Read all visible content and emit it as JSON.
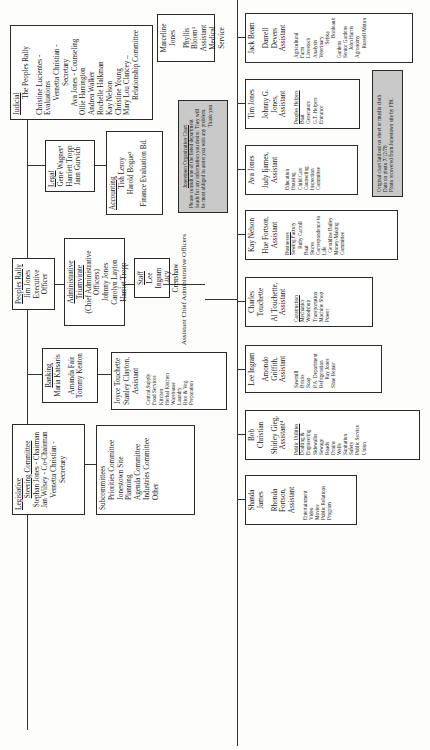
{
  "document": {
    "type": "Peoples Temple organizational chart (scanned, rotated)",
    "orientation": "rotated 90 degrees counter-clockwise"
  },
  "top_row": {
    "legislative": {
      "heading": "Legislative",
      "subheading": "Steering Committee",
      "members": [
        "Stephan Jones - Chairman",
        "Jan Wilsey - Co-Chairman",
        "Vernetta Christian -",
        "Secretary"
      ]
    },
    "subcommittees": {
      "heading": "Subcommittees",
      "items": [
        "Priorities Committee",
        "Jonestown Site",
        "Planning",
        "Agenda Committee",
        "Industries Committee",
        "Other"
      ]
    },
    "banking": {
      "heading": "Banking",
      "members": [
        "Maria Katsaris",
        "Amanda Fair",
        "Tommy Keaton"
      ]
    },
    "food": {
      "heads": [
        "Joyce Touchette",
        "Stanley Clayton,",
        "Assistant"
      ],
      "items": [
        "Central Supply",
        "Food Services",
        "Kitchen",
        "Herbal Kitchen",
        "Warehouse",
        "Laundry",
        "Rice & Veg. Preparation"
      ]
    },
    "peoples_rally": {
      "heading": "Peoples Rally",
      "lines": [
        "Jim Jones",
        "Executive Officer"
      ]
    },
    "admin_triumvirate": {
      "heading": "Administrative Triumvirate",
      "subheading": "(Chief Administrative Officers)",
      "members": [
        "Johnny Jones",
        "Carolyn Layton",
        "Harriet Tropp"
      ]
    },
    "staff": {
      "heading": "Staff",
      "members": [
        "Lee Ingram",
        "Lucy Crenshaw"
      ]
    },
    "assistant_label": "Assistant Chief Administrative Officers",
    "legal": {
      "heading": "Legal",
      "members": [
        "Gene Wagner¹",
        "Harriett Tropp",
        "Jann Gurvich"
      ]
    },
    "accounting": {
      "heading": "Accounting",
      "members": [
        "Tish Leroy",
        "Harold Bogue²"
      ],
      "footer": "Finance Evaluation Bd."
    },
    "notice": {
      "title": "Jonestown Organization Chart",
      "body": [
        "Please consult one of the listed department",
        "heads for any information you desire. They will",
        "be most obliged to assist you with any problem."
      ],
      "signoff": "Thank you"
    },
    "judicial": {
      "heading": "Judicial",
      "subheading": "The Peoples Rally",
      "members": [
        "Christine Lucientes - Evaluations",
        "Vernetta Christian - Secretary",
        "Ava Jones - Counseling",
        "Ollie Harrington",
        "Andrea Walker",
        "Rochelle Halkman",
        "Kay Nelson",
        "Christine Young",
        "Mary Lou Clancey –",
        "Relationship Committee"
      ]
    },
    "medical": {
      "lines": [
        "Marceline Jones",
        "Phyllis Bloom³",
        "Assistant",
        "Medical Service"
      ]
    }
  },
  "departments": [
    {
      "head": "Shanda James",
      "assistant": [
        "Rhonda Fortson,",
        "Assistant"
      ],
      "area_heading": "",
      "items": [
        "Entertainment",
        "Video",
        "Movies",
        "Public Relations",
        "Program"
      ]
    },
    {
      "head": "Bob Christian",
      "assistant": [
        "Shirley Gieg,",
        "Assistant⁴"
      ],
      "area_heading": "Public Utilities",
      "items": [
        "Drafting &",
        "Engineering",
        "Sidewalks",
        "Sewage",
        "Roads",
        "Drains",
        "Wells",
        "Sanitation",
        "Safety",
        "Public Service",
        "Union"
      ]
    },
    {
      "head": "Lee Ingram",
      "assistant": [
        "Amondo",
        "Griffith,",
        "Assistant"
      ],
      "area_heading": "",
      "items": [
        "Sawmill",
        "Bricks",
        "Soap",
        "P.A. Department",
        "Refrigeration",
        "Ray Jones",
        "Shoe Repair"
      ]
    },
    {
      "head": "Charles Touchette",
      "assistant": [
        "Al Touchette,",
        "Assistant"
      ],
      "area_heading": "Construction",
      "items": [
        "Mechanics",
        "Woodshop",
        "Transportation",
        "Machine Shop",
        "Power"
      ]
    },
    {
      "head": "Kay Nelson",
      "assistant": [
        "Hue Fortson,",
        "Assistant"
      ],
      "area_heading": "Businesses",
      "items": [
        "Sewing Factory",
        "Ruby Carroll",
        "Boat",
        "Stores",
        "Correspondence to",
        "Life",
        "Geraldine Bailey",
        "Money-Making",
        "Committee"
      ]
    },
    {
      "head": "Ava Jones",
      "assistant": [
        "Judy Ijames,",
        "Assistant"
      ],
      "area_heading": "",
      "items": [
        "Education",
        "Housing",
        "Child Care",
        "Counseling",
        "Inspection",
        "Committee"
      ]
    },
    {
      "head": "Tim Jones",
      "assistant": [
        "Johnny G. Jones,",
        "Assistant"
      ],
      "area_heading": "Peoples Helpers",
      "items": [
        "Boat",
        "Generators",
        "G.T. Helpers",
        "Entrance"
      ]
    },
    {
      "head": "Jack Beam",
      "assistant": [
        "Darrell Devers",
        "Assistant"
      ],
      "area_heading": "",
      "items": [
        "Agricultural",
        "Farm",
        "Livestock",
        "Analysis",
        "Veterinary",
        "Setika",
        "Bordeaux",
        "Gardens",
        "Senior Gardens",
        "John Harris",
        "Agronomy",
        "Russell Moton"
      ]
    }
  ],
  "source_note": {
    "lines": [
      "Original chart laid out on sheet or muslin cloth",
      "Date on photo 7/12/78",
      "Photo recovered from Jonestown site by FBI."
    ]
  },
  "colors": {
    "paper": "#fdfdfb",
    "line": "#333333",
    "shaded_box": "#c9c9c9",
    "text": "#1a1a1a"
  }
}
